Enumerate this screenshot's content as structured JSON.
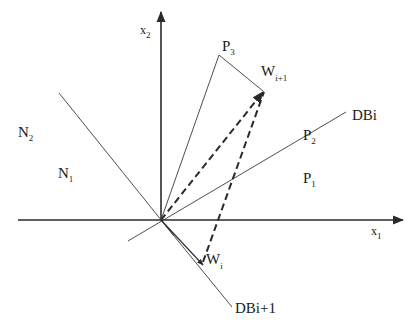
{
  "diagram": {
    "type": "vector-geometry",
    "colors": {
      "line": "#2a2a2a",
      "background": "#ffffff"
    },
    "axes": {
      "x": {
        "label": "x",
        "subscript": "1"
      },
      "y": {
        "label": "x",
        "subscript": "2"
      }
    },
    "regions": [
      {
        "id": "N2",
        "label": "N",
        "subscript": "2"
      },
      {
        "id": "N1",
        "label": "N",
        "subscript": "1"
      },
      {
        "id": "P1",
        "label": "P",
        "subscript": "1"
      },
      {
        "id": "P2",
        "label": "P",
        "subscript": "2"
      },
      {
        "id": "P3",
        "label": "P",
        "subscript": "3"
      }
    ],
    "boundaries": [
      {
        "id": "DBi",
        "label": "DBi"
      },
      {
        "id": "DBi+1",
        "label": "DBi+1"
      }
    ],
    "vectors": [
      {
        "id": "Wi",
        "label": "W",
        "subscript": "i"
      },
      {
        "id": "Wi+1",
        "label": "W",
        "subscript": "i+1"
      }
    ]
  }
}
